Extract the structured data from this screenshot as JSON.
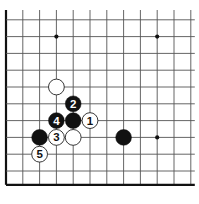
{
  "board": {
    "description": "Go diagram, lower-left corner region",
    "grid": {
      "origin_x": 6,
      "origin_y": 3,
      "spacing": 16.8,
      "cols": 12,
      "rows": 12,
      "left_edge": true,
      "bottom_edge": true,
      "line_color": "#555555",
      "edge_color": "#111111"
    },
    "star_points": [
      {
        "col": 3,
        "row": 2
      },
      {
        "col": 9,
        "row": 2
      },
      {
        "col": 9,
        "row": 8
      }
    ],
    "stones": [
      {
        "color": "white",
        "col": 3,
        "row": 5,
        "label": ""
      },
      {
        "color": "black",
        "col": 4,
        "row": 6,
        "label": "2"
      },
      {
        "color": "black",
        "col": 3,
        "row": 7,
        "label": "4"
      },
      {
        "color": "black",
        "col": 4,
        "row": 7,
        "label": ""
      },
      {
        "color": "white",
        "col": 5,
        "row": 7,
        "label": "1"
      },
      {
        "color": "black",
        "col": 2,
        "row": 8,
        "label": ""
      },
      {
        "color": "white",
        "col": 3,
        "row": 8,
        "label": "3"
      },
      {
        "color": "white",
        "col": 4,
        "row": 8,
        "label": ""
      },
      {
        "color": "black",
        "col": 7,
        "row": 8,
        "label": ""
      },
      {
        "color": "white",
        "col": 2,
        "row": 9,
        "label": "5"
      }
    ],
    "colors": {
      "black_stone": "#111111",
      "white_stone": "#ffffff",
      "white_stone_border": "#222222",
      "black_label": "#ffffff",
      "white_label": "#111111"
    }
  }
}
